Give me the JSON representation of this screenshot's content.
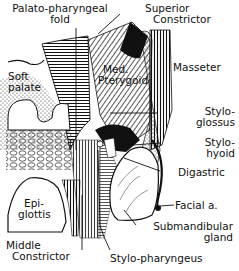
{
  "figure": {
    "type": "anatomical-illustration",
    "style": "black-and-white engraving / line drawing",
    "labels": {
      "palato_pharyngeal_fold": [
        "Palato-pharyngeal",
        "fold"
      ],
      "superior_constrictor": [
        "Superior",
        "Constrictor"
      ],
      "masseter": "Masseter",
      "soft_palate": [
        "Soft",
        "palate"
      ],
      "med_pterygoid": [
        "Med.",
        "Pterygoid"
      ],
      "stylo_glossus": [
        "Stylo-",
        "glossus"
      ],
      "stylo_hyoid": [
        "Stylo-",
        "hyoid"
      ],
      "digastric": "Digastric",
      "epiglottis": [
        "Epi-",
        "glottis"
      ],
      "facial_a": "Facial a.",
      "submandibular_gland": [
        "Submandibular",
        "gland"
      ],
      "middle_constrictor": [
        "Middle",
        "Constrictor"
      ],
      "stylo_pharyngeus": "Stylo-pharyngeus"
    }
  }
}
